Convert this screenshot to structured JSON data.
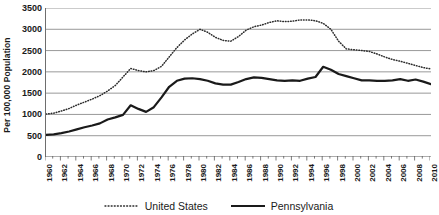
{
  "chart_data": {
    "type": "line",
    "title": "",
    "subtitle": "",
    "xlabel": "",
    "ylabel": "Per 100,000 Population",
    "ylim": [
      0,
      3500
    ],
    "ytick_step": 500,
    "yticks": [
      3500,
      3000,
      2500,
      2000,
      1500,
      1000,
      500,
      0
    ],
    "xlim": [
      1960,
      2010
    ],
    "xticks": [
      1960,
      1962,
      1964,
      1966,
      1968,
      1970,
      1972,
      1974,
      1976,
      1978,
      1980,
      1982,
      1984,
      1986,
      1988,
      1990,
      1992,
      1994,
      1996,
      1998,
      2000,
      2002,
      2004,
      2006,
      2008,
      2010
    ],
    "xtick_minor_interval": 1,
    "grid": "horizontal",
    "legend_position": "bottom",
    "x": [
      1960,
      1961,
      1962,
      1963,
      1964,
      1965,
      1966,
      1967,
      1968,
      1969,
      1970,
      1971,
      1972,
      1973,
      1974,
      1975,
      1976,
      1977,
      1978,
      1979,
      1980,
      1981,
      1982,
      1983,
      1984,
      1985,
      1986,
      1987,
      1988,
      1989,
      1990,
      1991,
      1992,
      1993,
      1994,
      1995,
      1996,
      1997,
      1998,
      1999,
      2000,
      2001,
      2002,
      2003,
      2004,
      2005,
      2006,
      2007,
      2008,
      2009,
      2010
    ],
    "series": [
      {
        "name": "United States",
        "style": "dotted",
        "color": "#2b2b2b",
        "values": [
          1010,
          1030,
          1080,
          1140,
          1220,
          1290,
          1360,
          1440,
          1550,
          1680,
          1880,
          2080,
          2030,
          2000,
          2030,
          2130,
          2350,
          2570,
          2750,
          2890,
          3000,
          2930,
          2810,
          2740,
          2720,
          2830,
          2980,
          3060,
          3100,
          3160,
          3200,
          3180,
          3190,
          3220,
          3220,
          3200,
          3140,
          3000,
          2720,
          2540,
          2520,
          2500,
          2480,
          2420,
          2350,
          2290,
          2250,
          2200,
          2150,
          2100,
          2070
        ]
      },
      {
        "name": "Pennsylvania",
        "style": "solid",
        "color": "#1a1a1a",
        "values": [
          520,
          530,
          560,
          600,
          650,
          700,
          740,
          790,
          880,
          930,
          990,
          1215,
          1130,
          1060,
          1170,
          1400,
          1650,
          1790,
          1840,
          1850,
          1830,
          1790,
          1730,
          1700,
          1700,
          1760,
          1830,
          1870,
          1860,
          1830,
          1800,
          1790,
          1800,
          1790,
          1840,
          1880,
          2120,
          2050,
          1950,
          1900,
          1850,
          1800,
          1800,
          1790,
          1790,
          1800,
          1830,
          1790,
          1820,
          1770,
          1710
        ]
      }
    ]
  },
  "legend": {
    "items": [
      {
        "label": "United States"
      },
      {
        "label": "Pennsylvania"
      }
    ]
  }
}
